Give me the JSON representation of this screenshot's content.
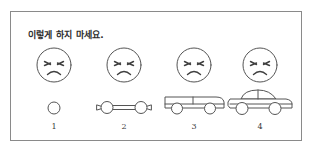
{
  "page": {
    "caption": "이렇게 하지 마세요.",
    "background_color": "#ffffff",
    "frame_border_color": "#8a8a8a",
    "line_color": "#555555"
  },
  "steps": [
    {
      "number": "1",
      "face": "angry-face",
      "vehicle": "wheel-circle",
      "vehicle_label": "single wheel"
    },
    {
      "number": "2",
      "face": "angry-face",
      "vehicle": "axle-with-two-wheels",
      "vehicle_label": "axle with two wheels"
    },
    {
      "number": "3",
      "face": "angry-face",
      "vehicle": "van-body-on-wheels",
      "vehicle_label": "flat van body on wheels"
    },
    {
      "number": "4",
      "face": "angry-face",
      "vehicle": "finished-car",
      "vehicle_label": "finished car with cabin"
    }
  ]
}
